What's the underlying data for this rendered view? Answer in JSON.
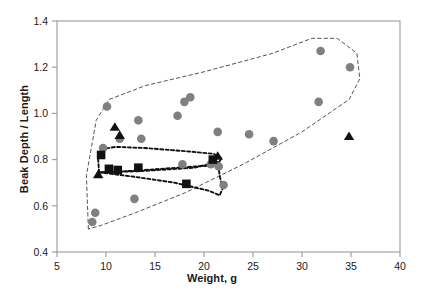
{
  "chart_data": {
    "type": "scatter",
    "title": "",
    "xlabel": "Weight, g",
    "ylabel": "Beak Depth / Length",
    "xlim": [
      5,
      40
    ],
    "ylim": [
      0.4,
      1.4
    ],
    "xticks": [
      5,
      10,
      15,
      20,
      25,
      30,
      35,
      40
    ],
    "xtick_labels": [
      "5",
      "10",
      "15",
      "20",
      "25",
      "30",
      "35",
      "40"
    ],
    "yticks": [
      0.4,
      0.6,
      0.8,
      1.0,
      1.2,
      1.4
    ],
    "ytick_labels": [
      "0.4",
      "0.6",
      "0.8",
      "1.0",
      "1.2",
      "1.4"
    ],
    "grid": false,
    "legend": null,
    "series": [
      {
        "name": "circles",
        "marker": "circle",
        "color": "#808080",
        "points": [
          [
            8.6,
            0.53
          ],
          [
            8.9,
            0.57
          ],
          [
            9.7,
            0.85
          ],
          [
            10.1,
            1.03
          ],
          [
            11.4,
            0.89
          ],
          [
            12.9,
            0.63
          ],
          [
            13.3,
            0.97
          ],
          [
            13.6,
            0.89
          ],
          [
            17.3,
            0.99
          ],
          [
            17.8,
            0.78
          ],
          [
            18.0,
            1.05
          ],
          [
            18.6,
            1.07
          ],
          [
            20.7,
            0.78
          ],
          [
            21.4,
            0.92
          ],
          [
            21.5,
            0.77
          ],
          [
            22.0,
            0.69
          ],
          [
            24.6,
            0.91
          ],
          [
            27.1,
            0.88
          ],
          [
            31.7,
            1.05
          ],
          [
            31.9,
            1.27
          ],
          [
            34.9,
            1.2
          ]
        ]
      },
      {
        "name": "squares",
        "marker": "square",
        "color": "#111111",
        "points": [
          [
            9.5,
            0.82
          ],
          [
            10.3,
            0.76
          ],
          [
            11.2,
            0.755
          ],
          [
            13.3,
            0.765
          ],
          [
            18.2,
            0.695
          ],
          [
            20.9,
            0.8
          ]
        ]
      },
      {
        "name": "triangles",
        "marker": "triangle",
        "color": "#111111",
        "points": [
          [
            10.9,
            0.94
          ],
          [
            11.4,
            0.905
          ],
          [
            9.2,
            0.735
          ],
          [
            21.4,
            0.815
          ],
          [
            34.8,
            0.9
          ]
        ]
      }
    ],
    "hulls": [
      {
        "name": "outer-hull",
        "style": "dashed-thin",
        "color": "#555555",
        "points": [
          [
            8.2,
            0.5
          ],
          [
            8.0,
            0.73
          ],
          [
            9.0,
            0.97
          ],
          [
            10.3,
            1.06
          ],
          [
            14.0,
            1.12
          ],
          [
            20.0,
            1.18
          ],
          [
            27.0,
            1.26
          ],
          [
            31.0,
            1.325
          ],
          [
            33.6,
            1.325
          ],
          [
            35.6,
            1.26
          ],
          [
            35.9,
            1.15
          ],
          [
            34.8,
            1.06
          ],
          [
            30.0,
            0.92
          ],
          [
            24.0,
            0.78
          ],
          [
            18.0,
            0.655
          ],
          [
            13.0,
            0.57
          ],
          [
            9.5,
            0.515
          ],
          [
            8.2,
            0.5
          ]
        ]
      },
      {
        "name": "inner-hull-upper",
        "style": "dashed-thick",
        "color": "#111111",
        "points": [
          [
            9.2,
            0.8
          ],
          [
            9.5,
            0.845
          ],
          [
            11.0,
            0.855
          ],
          [
            14.0,
            0.85
          ],
          [
            18.5,
            0.835
          ],
          [
            21.0,
            0.825
          ],
          [
            21.8,
            0.805
          ],
          [
            21.3,
            0.775
          ],
          [
            19.0,
            0.77
          ],
          [
            14.0,
            0.755
          ],
          [
            10.2,
            0.745
          ],
          [
            9.3,
            0.745
          ],
          [
            9.2,
            0.8
          ]
        ]
      },
      {
        "name": "inner-hull-lower",
        "style": "dashed-thick",
        "color": "#111111",
        "points": [
          [
            9.3,
            0.745
          ],
          [
            13.0,
            0.725
          ],
          [
            17.0,
            0.7
          ],
          [
            20.5,
            0.665
          ],
          [
            21.6,
            0.645
          ],
          [
            21.9,
            0.675
          ],
          [
            21.6,
            0.73
          ],
          [
            21.4,
            0.79
          ],
          [
            19.0,
            0.765
          ],
          [
            13.5,
            0.75
          ],
          [
            9.3,
            0.745
          ]
        ]
      }
    ]
  },
  "figure": {
    "background": "#ffffff",
    "frame_color": "#9a9a9a"
  }
}
